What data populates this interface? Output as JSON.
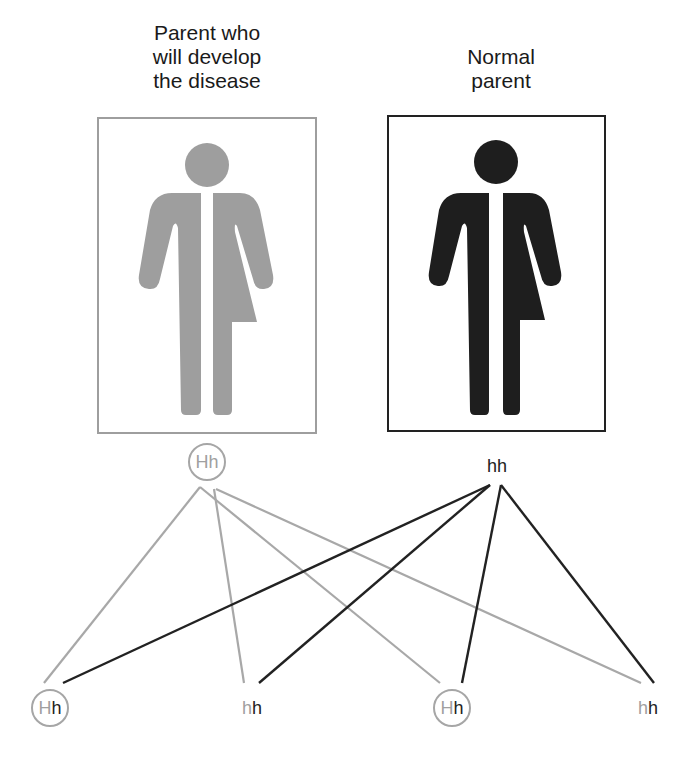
{
  "parents": {
    "affected": {
      "title_lines": [
        "Parent who",
        "will develop",
        "the disease"
      ],
      "genotype": {
        "allele1": "H",
        "allele2": "h"
      },
      "color": "#9e9e9e",
      "icon": "all-gender-figure-icon"
    },
    "normal": {
      "title_lines": [
        "Normal",
        "parent"
      ],
      "genotype": {
        "allele1": "h",
        "allele2": "h"
      },
      "color": "#222222",
      "icon": "all-gender-figure-icon"
    }
  },
  "children": [
    {
      "allele_from_affected": "H",
      "allele_from_normal": "h",
      "circled": true
    },
    {
      "allele_from_affected": "h",
      "allele_from_normal": "h",
      "circled": false
    },
    {
      "allele_from_affected": "H",
      "allele_from_normal": "h",
      "circled": true
    },
    {
      "allele_from_affected": "h",
      "allele_from_normal": "h",
      "circled": false
    }
  ],
  "colors": {
    "affected_gray": "#a0a0a0",
    "normal_dark": "#222222",
    "background": "#ffffff"
  }
}
